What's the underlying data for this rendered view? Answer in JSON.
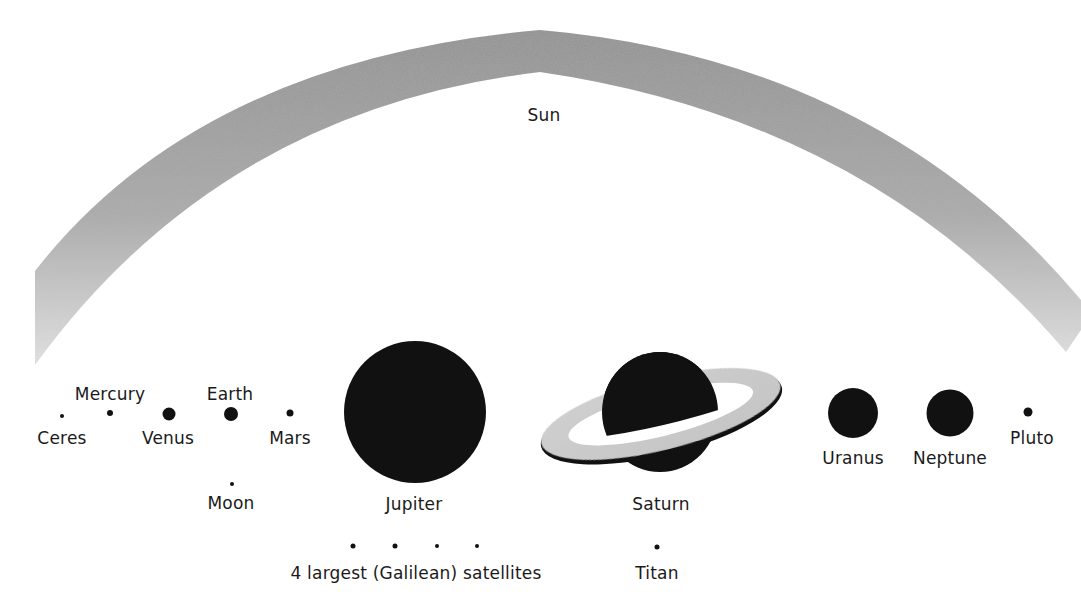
{
  "diagram": {
    "colors": {
      "body": "#111111",
      "sun_arc": "#9a9a9a",
      "ring": "#cfcfcf",
      "text": "#1a1a1a"
    }
  },
  "sun": {
    "label": "Sun"
  },
  "bodies": [
    {
      "id": "ceres",
      "label": "Ceres",
      "x": 62,
      "y": 416,
      "d": 4,
      "label_x": 62,
      "label_y": 428
    },
    {
      "id": "mercury",
      "label": "Mercury",
      "x": 110,
      "y": 413,
      "d": 6,
      "label_x": 110,
      "label_y": 384
    },
    {
      "id": "venus",
      "label": "Venus",
      "x": 169,
      "y": 414,
      "d": 13,
      "label_x": 168,
      "label_y": 428
    },
    {
      "id": "earth",
      "label": "Earth",
      "x": 231,
      "y": 414,
      "d": 14,
      "label_x": 230,
      "label_y": 384
    },
    {
      "id": "mars",
      "label": "Mars",
      "x": 290,
      "y": 413,
      "d": 7,
      "label_x": 290,
      "label_y": 428
    },
    {
      "id": "moon",
      "label": "Moon",
      "x": 232,
      "y": 484,
      "d": 4,
      "label_x": 231,
      "label_y": 493
    },
    {
      "id": "jupiter",
      "label": "Jupiter",
      "x": 415,
      "y": 412,
      "d": 142,
      "label_x": 414,
      "label_y": 494
    },
    {
      "id": "uranus",
      "label": "Uranus",
      "x": 853,
      "y": 413,
      "d": 50,
      "label_x": 853,
      "label_y": 448
    },
    {
      "id": "neptune",
      "label": "Neptune",
      "x": 950,
      "y": 413,
      "d": 47,
      "label_x": 950,
      "label_y": 448
    },
    {
      "id": "pluto",
      "label": "Pluto",
      "x": 1028,
      "y": 412,
      "d": 9,
      "label_x": 1032,
      "label_y": 428
    }
  ],
  "saturn": {
    "label": "Saturn",
    "label_x": 661,
    "label_y": 494
  },
  "galilean": {
    "label": "4 largest (Galilean) satellites",
    "label_x": 416,
    "label_y": 563,
    "dots": [
      {
        "x": 353,
        "y": 546,
        "d": 5
      },
      {
        "x": 395,
        "y": 546,
        "d": 5
      },
      {
        "x": 437,
        "y": 546,
        "d": 4
      },
      {
        "x": 477,
        "y": 546,
        "d": 4
      }
    ]
  },
  "titan": {
    "label": "Titan",
    "x": 657,
    "y": 547,
    "d": 5,
    "label_x": 657,
    "label_y": 563
  }
}
